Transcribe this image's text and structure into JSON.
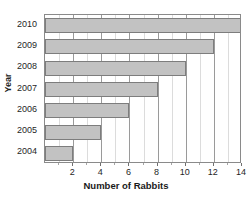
{
  "chart_data": {
    "type": "bar",
    "orientation": "horizontal",
    "title": "Number of rabbits in a forest",
    "title_clipped": true,
    "xlabel": "Number of Rabbits",
    "ylabel": "Year",
    "categories": [
      "2004",
      "2005",
      "2006",
      "2007",
      "2008",
      "2009",
      "2010"
    ],
    "values": [
      2,
      4,
      6,
      8,
      10,
      12,
      14
    ],
    "display_order": [
      "2010",
      "2009",
      "2008",
      "2007",
      "2006",
      "2005",
      "2004"
    ],
    "xlim": [
      0,
      14
    ],
    "xticks": [
      2,
      4,
      6,
      8,
      10,
      12,
      14
    ],
    "xtick_labels": [
      "2",
      "4",
      "6",
      "8",
      "10",
      "12",
      "14"
    ],
    "minor_xticks": [
      1,
      3,
      5,
      7,
      9,
      11,
      13
    ],
    "grid": true,
    "legend": false,
    "bar_color": "#c2c2c2",
    "bar_edge_color": "#7d7d7d",
    "grid_major_color": "#9a9a9a",
    "grid_minor_color": "#dcdcdc",
    "axis_color": "#8a8a8a",
    "text_color": "#1f1f1f",
    "background": "#ffffff"
  }
}
